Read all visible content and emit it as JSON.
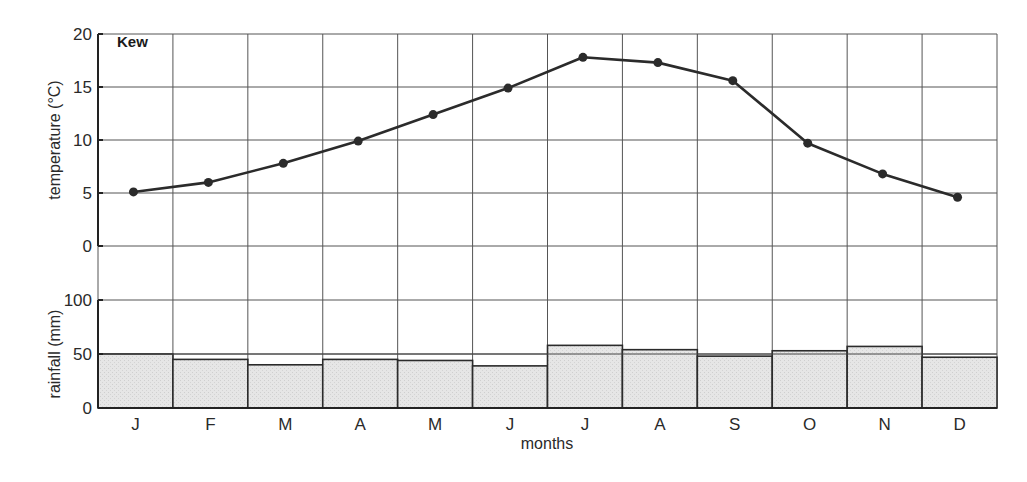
{
  "chart_data": [
    {
      "type": "line",
      "title": "Kew",
      "xlabel": "months",
      "ylabel": "temperature (°C)",
      "categories": [
        "J",
        "F",
        "M",
        "A",
        "M",
        "J",
        "J",
        "A",
        "S",
        "O",
        "N",
        "D"
      ],
      "series": [
        {
          "name": "temperature",
          "values": [
            5.1,
            6.0,
            7.8,
            9.9,
            12.4,
            14.9,
            17.8,
            17.3,
            15.6,
            9.7,
            6.8,
            4.6
          ]
        }
      ],
      "ylim": [
        0,
        20
      ],
      "yticks": [
        0,
        5,
        10,
        15,
        20
      ],
      "grid": true,
      "markers": true
    },
    {
      "type": "bar",
      "title": "",
      "xlabel": "months",
      "ylabel": "rainfall (mm)",
      "categories": [
        "J",
        "F",
        "M",
        "A",
        "M",
        "J",
        "J",
        "A",
        "S",
        "O",
        "N",
        "D"
      ],
      "series": [
        {
          "name": "rainfall",
          "values": [
            50,
            45,
            40,
            45,
            44,
            39,
            58,
            54,
            48,
            53,
            57,
            47
          ]
        }
      ],
      "ylim": [
        0,
        100
      ],
      "yticks": [
        0,
        50,
        100
      ],
      "grid": true
    }
  ],
  "labels": {
    "station": "Kew",
    "temp_axis": "temperature (°C)",
    "rain_axis": "rainfall (mm)",
    "x_axis": "months"
  },
  "colors": {
    "line": "#2b2b2b",
    "bar_fill": "#e4e4e4",
    "grid": "#555555"
  }
}
